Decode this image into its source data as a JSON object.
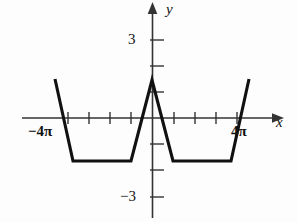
{
  "figure": {
    "kind": "cartesian-line-graph",
    "background_color": "#fdfdfd",
    "curve_color": "#111111",
    "axis_color": "#333333"
  },
  "axes": {
    "x_axis_label": "x",
    "y_axis_label": "y",
    "x_tick_labels": [
      "−4π",
      "4π"
    ],
    "x_tick_label_left": "−4π",
    "x_tick_label_right": "4π",
    "y_tick_label_positive": "3",
    "y_tick_label_negative": "−3"
  },
  "chart_data": {
    "type": "line",
    "title": "",
    "xlabel": "x",
    "ylabel": "y",
    "xlim": [
      -14.5,
      14.5
    ],
    "ylim": [
      -3.6,
      3.4
    ],
    "x_ticks": [
      -12.566,
      -10.996,
      -9.425,
      -7.854,
      -6.283,
      -4.712,
      -3.142,
      -1.571,
      1.571,
      3.142,
      4.712,
      6.283,
      7.854,
      9.425,
      10.996,
      12.566
    ],
    "x_tick_labels": {
      "-12.566": "−4π",
      "12.566": "4π"
    },
    "y_ticks": [
      -3,
      -2,
      -1,
      1,
      2,
      3
    ],
    "y_tick_labels": {
      "3": "3",
      "-3": "−3"
    },
    "grid": false,
    "legend": null,
    "series": [
      {
        "name": "waveform",
        "x": [
          -14.3,
          -12.0,
          -10.2,
          -4.6,
          -2.6,
          0.0,
          2.6,
          4.6,
          10.2,
          12.0,
          14.3
        ],
        "y": [
          1.5,
          -1.65,
          -1.65,
          -1.65,
          -1.65,
          1.5,
          -1.65,
          -1.65,
          -1.65,
          -1.65,
          1.5
        ],
        "vertices_px": [
          [
            55,
            79
          ],
          [
            73,
            161
          ],
          [
            97,
            161
          ],
          [
            118,
            161
          ],
          [
            131,
            161
          ],
          [
            152,
            80
          ],
          [
            173,
            161
          ],
          [
            186,
            161
          ],
          [
            207,
            161
          ],
          [
            231,
            161
          ],
          [
            249,
            79
          ]
        ]
      }
    ]
  }
}
